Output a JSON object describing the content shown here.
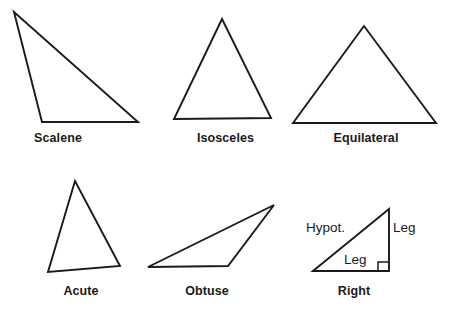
{
  "page": {
    "width": 453,
    "height": 312,
    "background_color": "#ffffff",
    "stroke_color": "#1a1a1a",
    "title_text": "Types of Triangles"
  },
  "figures": [
    {
      "id": "scalene",
      "label": "Scalene",
      "row": 1,
      "column": 1,
      "vertices": [
        [
          14,
          12
        ],
        [
          42,
          122
        ],
        [
          138,
          122
        ]
      ],
      "description": "Scalene triangle with three unequal sides"
    },
    {
      "id": "isosceles",
      "label": "Isosceles",
      "row": 1,
      "column": 2,
      "vertices": [
        [
          222,
          19
        ],
        [
          174,
          119
        ],
        [
          271,
          118
        ]
      ],
      "description": "Isosceles triangle with two equal sides"
    },
    {
      "id": "equilateral",
      "label": "Equilateral",
      "row": 1,
      "column": 3,
      "vertices": [
        [
          364,
          26
        ],
        [
          293,
          123
        ],
        [
          436,
          123
        ]
      ],
      "description": "Equilateral triangle with three equal sides"
    },
    {
      "id": "acute",
      "label": "Acute",
      "row": 2,
      "column": 1,
      "vertices": [
        [
          75,
          181
        ],
        [
          48,
          272
        ],
        [
          120,
          266
        ]
      ],
      "description": "Acute triangle with all angles less than 90 degrees"
    },
    {
      "id": "obtuse",
      "label": "Obtuse",
      "row": 2,
      "column": 2,
      "vertices": [
        [
          148,
          267
        ],
        [
          274,
          205
        ],
        [
          228,
          266
        ]
      ],
      "description": "Obtuse triangle with one angle greater than 90 degrees"
    },
    {
      "id": "right",
      "label": "Right",
      "row": 2,
      "column": 3,
      "vertices": [
        [
          313,
          271
        ],
        [
          389,
          209
        ],
        [
          389,
          271
        ]
      ],
      "description": "Right triangle with one 90 degree angle",
      "right_angle_marker": {
        "corner": [
          389,
          271
        ],
        "size": 9
      },
      "side_labels": [
        {
          "id": "hypotenuse",
          "text": "Hypot.",
          "position": [
            306,
            220
          ]
        },
        {
          "id": "leg-vertical",
          "text": "Leg",
          "position": [
            393,
            220
          ]
        },
        {
          "id": "leg-horizontal",
          "text": "Leg",
          "position": [
            344,
            252
          ]
        }
      ]
    }
  ]
}
